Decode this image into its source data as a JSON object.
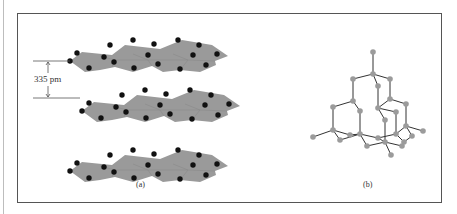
{
  "figure": {
    "panel_a": {
      "label": "(a)",
      "title": "graphite-layers",
      "layer_spacing_label": "335 pm",
      "layer_count": 3,
      "sheet_color": "#9a9a9a",
      "atom_color": "#111111"
    },
    "panel_b": {
      "label": "(b)",
      "title": "diamond-lattice",
      "atom_color": "#9b9b9b",
      "bond_color": "#333333"
    },
    "frame_color": "#555555"
  }
}
